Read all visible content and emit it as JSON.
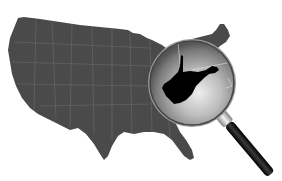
{
  "illustration": {
    "subject": "United States map with magnifying glass highlighting West Virginia",
    "highlighted_state": "West Virginia",
    "colors": {
      "background": "#ffffff",
      "map_fill": "#4a4a4a",
      "state_borders": "#6e6e6e",
      "highlighted_state_fill": "#000000",
      "lens_center": "#e6e6e6",
      "lens_edge": "#5a5a5a",
      "handle": "#111111",
      "ferrule": "#c8c8c8"
    }
  }
}
